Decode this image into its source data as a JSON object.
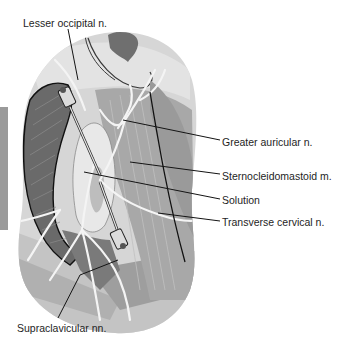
{
  "figure": {
    "colors": {
      "background": "#ffffff",
      "region_light": "#d9d9d9",
      "region_mid": "#b3b3b3",
      "muscle_dark": "#7d7d7d",
      "muscle_darker": "#5e5e5e",
      "nerve": "#f2f2f2",
      "solution": "#e6e6e6",
      "line": "#141414",
      "side_tab": "#9a9a9a"
    },
    "labels": [
      {
        "id": "lesser-occipital",
        "text": "Lesser occipital n.",
        "x": 23,
        "y": 17
      },
      {
        "id": "greater-auricular",
        "text": "Greater auricular n.",
        "x": 222,
        "y": 136
      },
      {
        "id": "sternocleidomastoid",
        "text": "Sternocleidomastoid m.",
        "x": 222,
        "y": 170
      },
      {
        "id": "solution",
        "text": "Solution",
        "x": 222,
        "y": 194
      },
      {
        "id": "transverse-cervical",
        "text": "Transverse cervical n.",
        "x": 222,
        "y": 216
      },
      {
        "id": "supraclavicular",
        "text": "Supraclavicular nn.",
        "x": 17,
        "y": 322
      }
    ]
  }
}
